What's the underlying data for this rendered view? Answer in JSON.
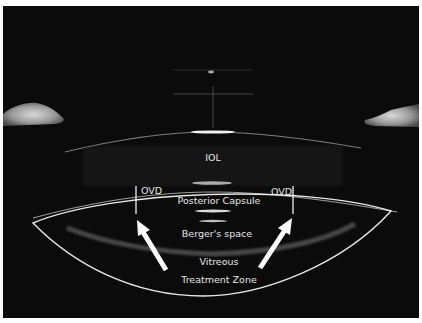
{
  "image": {
    "type": "anterior-segment OCT scan",
    "colors": {
      "background": "#0b0b0b",
      "annotation": "#e8e8e8",
      "frame": "#ffffff"
    }
  },
  "labels": {
    "iol": "IOL",
    "ovd_left": "OVD",
    "ovd_right": "OVD",
    "posterior_capsule": "Posterior Capsule",
    "bergers_space": "Berger's space",
    "vitreous": "Vitreous",
    "treatment_zone": "Treatment Zone"
  },
  "annotations": {
    "arrows": [
      "arrow-left-pointing-up-right",
      "arrow-right-pointing-up-left"
    ],
    "markers": [
      "ovd-left-bracket",
      "ovd-right-bracket"
    ],
    "outline": "treatment-zone-outline"
  }
}
